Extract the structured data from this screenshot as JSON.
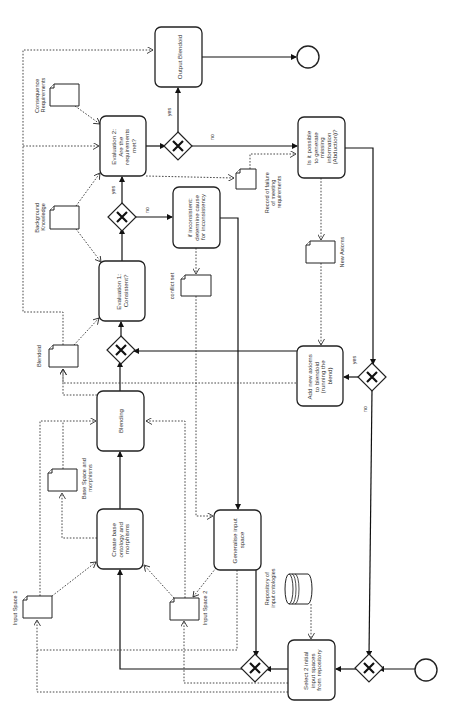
{
  "diagram": {
    "type": "BPMN process flow (rotated 90 degrees counter-clockwise)",
    "tasks": {
      "output_blendoid": [
        "Output Blendoid"
      ],
      "evaluation2": [
        "Evaluation 2:",
        "Are the",
        "requirements",
        "met?"
      ],
      "abduction": [
        "Is it possible",
        "to generate",
        "missing",
        "information",
        "(Abduction)?"
      ],
      "inconsistent": [
        "if inconsistent:",
        "determine cause",
        "for inconsistency"
      ],
      "evaluation1": [
        "Evaluation 1:",
        "Consistent?"
      ],
      "add_axioms": [
        "Add new axioms",
        "to blendoid",
        "(running the",
        "blend)"
      ],
      "blending": [
        "Blending"
      ],
      "create_base": [
        "Create base",
        "ontology and",
        "morphisms"
      ],
      "generalise": [
        "Generalise input",
        "space"
      ],
      "select_inputs": [
        "Select 2 initial",
        "input spaces",
        "from repository"
      ]
    },
    "documents": {
      "consequence_requirements": [
        "Consequence",
        "Requirements"
      ],
      "background_knowledge": [
        "Background",
        "Knowledge"
      ],
      "record_failure": [
        "Record of failure",
        "of meeting",
        "requirements"
      ],
      "new_axioms": [
        "New Axioms"
      ],
      "conflict_set": [
        "conflict set"
      ],
      "blendoid": [
        "Blendoid"
      ],
      "base_space": [
        "Base Space and",
        "morphisms"
      ],
      "input_space1": [
        "Input Space 1"
      ],
      "input_space2": [
        "Input Space 2"
      ]
    },
    "datastore": {
      "repository": [
        "Repository of",
        "input ontologies"
      ]
    },
    "gateway_labels": {
      "eval2_yes": "yes",
      "eval2_no": "no",
      "eval1_yes": "yes",
      "eval1_no": "no",
      "abduction_yes": "yes",
      "abduction_no": "no"
    },
    "events": {
      "start": "start-event",
      "end": "end-event"
    },
    "colors": {
      "stroke": "#222222",
      "background": "#ffffff",
      "text": "#333333"
    }
  }
}
